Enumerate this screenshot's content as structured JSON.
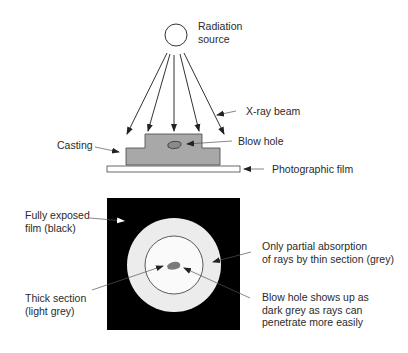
{
  "diagram": {
    "labels": {
      "radiation_source": "Radiation\nsource",
      "xray_beam": "X-ray beam",
      "casting": "Casting",
      "blow_hole": "Blow hole",
      "photographic_film": "Photographic film",
      "fully_exposed": "Fully exposed\nfilm (black)",
      "partial_absorption": "Only partial absorption\nof rays by thin section (grey)",
      "thick_section": "Thick section\n(light grey)",
      "blow_hole_result": "Blow hole shows up as\ndark grey as rays can\npenetrate more easily"
    },
    "colors": {
      "casting": "#a8a8a8",
      "film_black": "#000000",
      "thin_section": "#ececec",
      "blow_hole": "#7a7a7a",
      "line": "#333333"
    }
  }
}
